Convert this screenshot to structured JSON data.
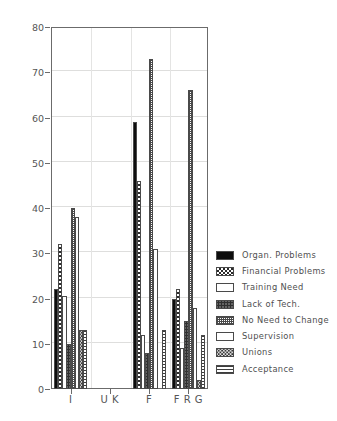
{
  "chart_data": {
    "type": "bar",
    "title": "",
    "xlabel": "",
    "ylabel": "",
    "ylim": [
      0,
      80
    ],
    "yticks": [
      0,
      10,
      20,
      30,
      40,
      50,
      60,
      70,
      80
    ],
    "grid": true,
    "legend_position": "right",
    "categories": [
      "I",
      "U K",
      "F",
      "F R G"
    ],
    "series": [
      {
        "name": "Organ. Problems",
        "pattern": "solid-black",
        "values": [
          22,
          0,
          59,
          20
        ]
      },
      {
        "name": "Financial Problems",
        "pattern": "checkerboard",
        "values": [
          32,
          0,
          46,
          22
        ]
      },
      {
        "name": "Training Need",
        "pattern": "light-fill",
        "values": [
          20.5,
          0,
          12,
          9
        ]
      },
      {
        "name": "Lack of Tech.",
        "pattern": "dark-speckle",
        "values": [
          10,
          0,
          8,
          15
        ]
      },
      {
        "name": "No Need to Change",
        "pattern": "fine-dot-grid",
        "values": [
          40,
          0,
          73,
          66
        ]
      },
      {
        "name": "Supervision",
        "pattern": "white-fill",
        "values": [
          38,
          0,
          31,
          18
        ]
      },
      {
        "name": "Unions",
        "pattern": "medium-speckle",
        "values": [
          13,
          0,
          0,
          2
        ]
      },
      {
        "name": "Acceptance",
        "pattern": "horizontal-lines",
        "values": [
          13,
          0,
          13,
          12
        ]
      }
    ]
  },
  "legend": {
    "items": [
      {
        "label": "Organ. Problems"
      },
      {
        "label": "Financial Problems"
      },
      {
        "label": "Training Need"
      },
      {
        "label": "Lack of Tech."
      },
      {
        "label": "No Need to Change"
      },
      {
        "label": "Supervision"
      },
      {
        "label": "Unions"
      },
      {
        "label": "Acceptance"
      }
    ]
  },
  "axis": {
    "y_tick_labels": [
      "80",
      "70",
      "60",
      "50",
      "40",
      "30",
      "20",
      "10",
      "0"
    ],
    "x_tick_labels": [
      "I",
      "U K",
      "F",
      "F R G"
    ]
  },
  "colors": {
    "axis": "#6b6b6b",
    "grid": "#dededd",
    "text": "#4f4f4f",
    "bar_outline": "#4a4a4a",
    "background": "#ffffff"
  }
}
